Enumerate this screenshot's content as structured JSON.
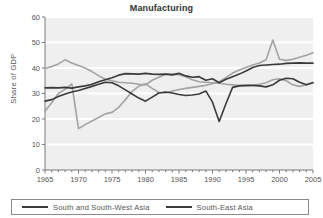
{
  "chart_data": {
    "type": "line",
    "title": "Manufacturing",
    "xlabel": "",
    "ylabel": "Share of GDP",
    "xlim": [
      1965,
      2005
    ],
    "ylim": [
      0,
      60
    ],
    "ytick_step": 10,
    "xtick_step": 5,
    "xticks": [
      "1965",
      "1970",
      "1975",
      "1980",
      "1985",
      "1990",
      "1995",
      "2000",
      "2005"
    ],
    "yticks": [
      "0",
      "10",
      "20",
      "30",
      "40",
      "50",
      "60"
    ],
    "grid": "horizontal-white-on-gray",
    "legend_position": "bottom",
    "plot_background": "#efefef",
    "gridline_color": "#ffffff",
    "x": [
      1965,
      1966,
      1967,
      1968,
      1969,
      1970,
      1971,
      1972,
      1973,
      1974,
      1975,
      1976,
      1977,
      1978,
      1979,
      1980,
      1981,
      1982,
      1983,
      1984,
      1985,
      1986,
      1987,
      1988,
      1989,
      1990,
      1991,
      1992,
      1993,
      1994,
      1995,
      1996,
      1997,
      1998,
      1999,
      2000,
      2001,
      2002,
      2003,
      2004,
      2005
    ],
    "series": [
      {
        "name": "South and South-West Asia",
        "color": "#3a3a3a",
        "values": [
          32.2,
          32.3,
          32.2,
          32.4,
          32.1,
          32.6,
          33.0,
          33.6,
          34.6,
          35.4,
          36.2,
          37.2,
          37.8,
          37.7,
          37.6,
          37.9,
          37.6,
          37.5,
          37.6,
          37.3,
          37.9,
          36.9,
          36.4,
          36.6,
          35.2,
          35.8,
          34.2,
          35.6,
          36.6,
          37.6,
          38.8,
          40.2,
          41.0,
          41.2,
          41.4,
          41.5,
          41.8,
          41.9,
          42.0,
          41.9,
          41.9
        ]
      },
      {
        "name": "South-East Asia",
        "color": "#3a3a3a",
        "values": [
          27.0,
          27.6,
          28.8,
          29.8,
          30.6,
          31.2,
          32.0,
          32.8,
          33.6,
          34.4,
          34.2,
          33.0,
          31.4,
          29.8,
          28.2,
          27.0,
          28.6,
          30.2,
          30.6,
          30.2,
          29.6,
          29.2,
          29.4,
          29.8,
          31.0,
          26.6,
          19.0,
          26.0,
          32.4,
          33.0,
          33.2,
          33.2,
          33.0,
          32.6,
          33.4,
          35.2,
          36.0,
          35.8,
          34.4,
          33.4,
          34.2
        ]
      },
      {
        "name": "series-gray-upper",
        "color": "#a3a3a3",
        "values": [
          39.8,
          40.6,
          41.6,
          43.2,
          42.0,
          41.0,
          40.0,
          38.6,
          37.0,
          35.6,
          35.0,
          34.4,
          34.2,
          34.0,
          33.6,
          33.4,
          35.2,
          36.4,
          37.6,
          37.6,
          37.4,
          36.6,
          35.4,
          34.6,
          34.4,
          34.2,
          34.0,
          33.6,
          33.4,
          33.2,
          33.0,
          33.2,
          33.6,
          34.2,
          35.4,
          35.8,
          35.0,
          33.4,
          32.8,
          33.4,
          34.4
        ]
      },
      {
        "name": "series-gray-rising",
        "color": "#a3a3a3",
        "values": [
          23.0,
          26.4,
          30.0,
          31.6,
          33.8,
          16.2,
          17.8,
          19.2,
          20.6,
          22.0,
          22.6,
          24.6,
          27.6,
          30.8,
          32.8,
          33.8,
          32.0,
          30.4,
          30.2,
          31.0,
          31.6,
          32.0,
          32.4,
          32.8,
          33.2,
          33.8,
          34.6,
          36.2,
          38.0,
          39.2,
          40.2,
          41.2,
          42.0,
          43.2,
          51.0,
          43.4,
          43.0,
          43.4,
          44.2,
          45.0,
          46.0
        ]
      }
    ]
  },
  "legend": {
    "entries": [
      {
        "label": "South and South-West Asia",
        "color": "#3a3a3a"
      },
      {
        "label": "South-East Asia",
        "color": "#3a3a3a"
      }
    ]
  }
}
